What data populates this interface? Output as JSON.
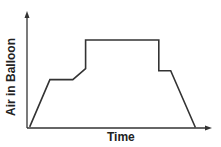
{
  "chart_data": {
    "type": "line",
    "title": "",
    "xlabel": "Time",
    "ylabel": "Air in Balloon",
    "grid": false,
    "legend": null,
    "x_ticks": [],
    "y_ticks": [],
    "xlim": [
      0,
      10
    ],
    "ylim": [
      0,
      10
    ],
    "series": [
      {
        "name": "Air in Balloon",
        "points": [
          {
            "x": 0.15,
            "y": 0.1
          },
          {
            "x": 1.25,
            "y": 4.4
          },
          {
            "x": 2.5,
            "y": 4.4
          },
          {
            "x": 3.2,
            "y": 5.4
          },
          {
            "x": 3.2,
            "y": 8.0
          },
          {
            "x": 7.2,
            "y": 8.0
          },
          {
            "x": 7.2,
            "y": 5.2
          },
          {
            "x": 7.85,
            "y": 5.2
          },
          {
            "x": 9.2,
            "y": 0.05
          }
        ]
      }
    ],
    "colors": {
      "line": "#333333",
      "axis": "#333333",
      "text": "#222222"
    }
  },
  "pixel_map": {
    "origin": [
      27,
      128
    ],
    "x_end": 210,
    "y_end": 13,
    "x_scale": 18.3,
    "y_scale": 11.0
  }
}
